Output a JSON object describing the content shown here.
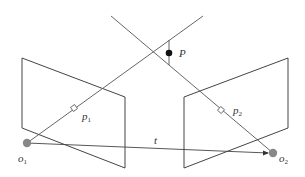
{
  "diagram": {
    "type": "epipolar-geometry",
    "colors": {
      "line": "#444444",
      "point_P": "#111111",
      "camera_center": "#888888",
      "background": "#ffffff"
    },
    "labels": {
      "P": "P",
      "p1_base": "p",
      "p1_sub": "1",
      "p2_base": "p",
      "p2_sub": "2",
      "t": "t",
      "o1_base": "o",
      "o1_sub": "1",
      "o2_base": "o",
      "o2_sub": "2"
    }
  }
}
